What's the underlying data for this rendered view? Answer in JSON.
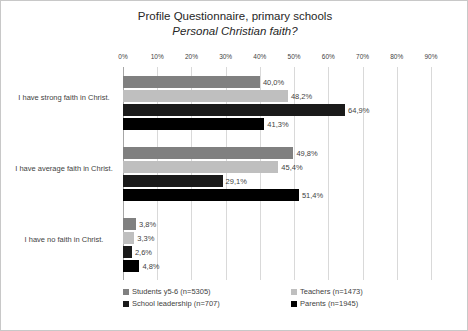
{
  "chart_data": {
    "type": "bar",
    "orientation": "horizontal",
    "title": "Profile Questionnaire, primary schools",
    "subtitle": "Personal Christian faith?",
    "xlabel": "",
    "ylabel": "",
    "xlim": [
      0,
      90
    ],
    "xticks": [
      "0%",
      "10%",
      "20%",
      "30%",
      "40%",
      "50%",
      "60%",
      "70%",
      "80%",
      "90%"
    ],
    "grid": true,
    "legend_position": "bottom",
    "categories": [
      "I have strong faith in Christ.",
      "I have average faith in Christ.",
      "I have no faith in Christ."
    ],
    "series": [
      {
        "name": "Students y5-6 (n=5305)",
        "color": "#808080",
        "values": [
          40.0,
          49.8,
          3.8
        ],
        "labels": [
          "40,0%",
          "49,8%",
          "3,8%"
        ]
      },
      {
        "name": "Teachers (n=1473)",
        "color": "#bfbfbf",
        "values": [
          48.2,
          45.4,
          3.3
        ],
        "labels": [
          "48,2%",
          "45,4%",
          "3,3%"
        ]
      },
      {
        "name": "School leadership (n=707)",
        "color": "#1a1a1a",
        "values": [
          64.9,
          29.1,
          2.6
        ],
        "labels": [
          "64,9%",
          "29,1%",
          "2,6%"
        ]
      },
      {
        "name": "Parents (n=1945)",
        "color": "#000000",
        "values": [
          41.3,
          51.4,
          4.8
        ],
        "labels": [
          "41,3%",
          "51,4%",
          "4,8%"
        ]
      }
    ]
  },
  "frame": {
    "border_color": "#c8c8c8",
    "background": "#ffffff",
    "gridline_color": "#d9d9d9",
    "axis_color": "#a6a6a6",
    "text_color": "#3f3f3f"
  }
}
